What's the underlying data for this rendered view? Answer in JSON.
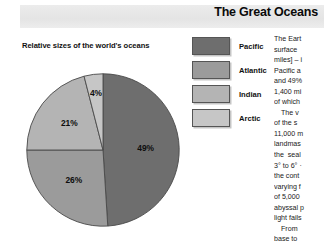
{
  "header": {
    "title": "The Great Oceans",
    "band_color": "#e8e8e8"
  },
  "figure": {
    "caption": "Relative sizes of the world's oceans"
  },
  "legend": {
    "items": [
      {
        "label": "Pacific",
        "color": "#6e6e6e"
      },
      {
        "label": "Atlantic",
        "color": "#9b9b9b"
      },
      {
        "label": "Indian",
        "color": "#b4b4b4"
      },
      {
        "label": "Arctic",
        "color": "#c6c6c6"
      }
    ]
  },
  "chart_data": {
    "type": "pie",
    "title": "Relative sizes of the world's oceans",
    "categories": [
      "Pacific",
      "Atlantic",
      "Indian",
      "Arctic"
    ],
    "values": [
      49,
      26,
      21,
      4
    ],
    "value_labels": [
      "49%",
      "26%",
      "21%",
      "4%"
    ],
    "colors": [
      "#6e6e6e",
      "#9b9b9b",
      "#b4b4b4",
      "#c6c6c6"
    ],
    "unit": "%",
    "legend_position": "top-right",
    "grid": false,
    "start_angle_deg": 0,
    "direction": "clockwise"
  },
  "article": {
    "paragraphs": [
      [
        "The Eart",
        "surface",
        "miles] – i",
        "Pacific a",
        "and 49%",
        "1,400 mi",
        "of which"
      ],
      [
        "The v",
        "of the s",
        "11,000 m",
        "landmas",
        "the  seal",
        "3° to 6° ·",
        "the cont",
        "varying f",
        "of 5,000",
        "abyssal p",
        "light fails"
      ],
      [
        "From",
        "base to"
      ]
    ]
  }
}
